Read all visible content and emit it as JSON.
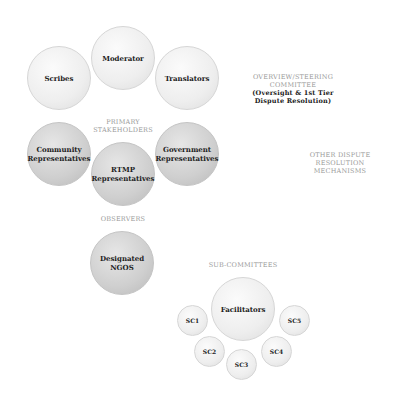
{
  "overview_committee": {
    "heading": "OVERVIEW/STEERING",
    "heading2": "COMMITTEE",
    "sub1": "(Oversight & 1st Tier",
    "sub2": "Dispute Resolution)",
    "members": [
      "Scribes",
      "Moderator",
      "Translators"
    ]
  },
  "primary_stakeholders": {
    "heading": "PRIMARY",
    "heading2": "STAKEHOLDERS",
    "members": [
      {
        "line1": "Community",
        "line2": "Representatives"
      },
      {
        "line1": "RTMP",
        "line2": "Representatives"
      },
      {
        "line1": "Government",
        "line2": "Representatives"
      }
    ]
  },
  "observers": {
    "heading": "OBSERVERS",
    "members": [
      {
        "line1": "Designated",
        "line2": "NGOS"
      }
    ]
  },
  "other_dispute": {
    "line1": "OTHER DISPUTE",
    "line2": "RESOLUTION",
    "line3": "MECHANISMS"
  },
  "sub_committees": {
    "heading": "SUB-COMMITTEES",
    "center": "Facilitators",
    "members": [
      "SC1",
      "SC2",
      "SC3",
      "SC4",
      "SC5"
    ]
  }
}
